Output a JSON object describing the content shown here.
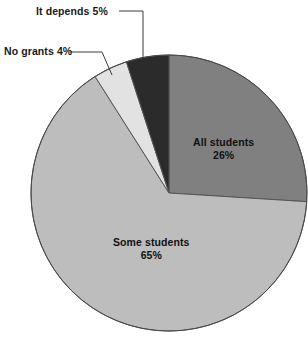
{
  "chart_data": {
    "type": "pie",
    "title": "",
    "subtitle": "",
    "xlabel": "",
    "ylabel": "",
    "legend_position": "none",
    "grid": false,
    "start_angle_deg": 0,
    "direction": "clockwise",
    "total_percent": 100,
    "categories": [
      "All students",
      "Some students",
      "No grants",
      "It depends"
    ],
    "values": [
      26,
      65,
      4,
      5
    ],
    "value_labels": [
      "26%",
      "65%",
      "4%",
      "5%"
    ],
    "colors": [
      "#808080",
      "#bdbdbd",
      "#e2e2e2",
      "#2b2b2b"
    ],
    "slices": [
      {
        "label": "All students",
        "value": 26,
        "value_label": "26%",
        "color": "#808080",
        "label_placement": "inside"
      },
      {
        "label": "Some students",
        "value": 65,
        "value_label": "65%",
        "color": "#bdbdbd",
        "label_placement": "inside"
      },
      {
        "label": "No grants",
        "value": 4,
        "value_label": "4%",
        "color": "#e2e2e2",
        "label_placement": "callout"
      },
      {
        "label": "It depends",
        "value": 5,
        "value_label": "5%",
        "color": "#2b2b2b",
        "label_placement": "callout"
      }
    ]
  },
  "callouts": {
    "it_depends": {
      "text": "It depends  5%"
    },
    "no_grants": {
      "text": "No grants 4%"
    }
  },
  "inside_labels": {
    "all_students": {
      "name": "All students",
      "percent": "26%"
    },
    "some_students": {
      "name": "Some students",
      "percent": "65%"
    }
  },
  "style": {
    "background": "#ffffff",
    "outline": "#4a4a4a",
    "text": "#111111"
  }
}
